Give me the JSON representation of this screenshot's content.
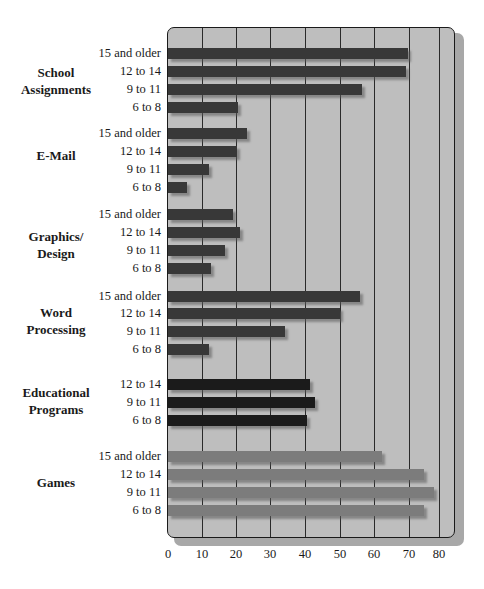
{
  "chart_data": {
    "type": "bar",
    "orientation": "horizontal",
    "title": "",
    "xlabel": "",
    "ylabel": "",
    "xlim": [
      0,
      80
    ],
    "x_ticks": [
      0,
      10,
      20,
      30,
      40,
      50,
      60,
      70,
      80
    ],
    "grid": "vertical",
    "legend": "none",
    "groups": [
      {
        "category": "School Assignments",
        "label_lines": [
          "School",
          "Assignments"
        ],
        "color": "#383838",
        "bars": [
          {
            "age": "15 and older",
            "value": 70
          },
          {
            "age": "12 to 14",
            "value": 69.5
          },
          {
            "age": "9 to 11",
            "value": 56.5
          },
          {
            "age": "6 to 8",
            "value": 20.5
          }
        ]
      },
      {
        "category": "E-Mail",
        "label_lines": [
          "E-Mail"
        ],
        "color": "#383838",
        "bars": [
          {
            "age": "15 and older",
            "value": 23
          },
          {
            "age": "12 to 14",
            "value": 20
          },
          {
            "age": "9 to 11",
            "value": 12
          },
          {
            "age": "6 to 8",
            "value": 5.5
          }
        ]
      },
      {
        "category": "Graphics/ Design",
        "label_lines": [
          "Graphics/",
          "Design"
        ],
        "color": "#383838",
        "bars": [
          {
            "age": "15 and older",
            "value": 19
          },
          {
            "age": "12 to 14",
            "value": 21
          },
          {
            "age": "9 to 11",
            "value": 16.5
          },
          {
            "age": "6 to 8",
            "value": 12.5
          }
        ]
      },
      {
        "category": "Word Processing",
        "label_lines": [
          "Word",
          "Processing"
        ],
        "color": "#383838",
        "bars": [
          {
            "age": "15 and older",
            "value": 56
          },
          {
            "age": "12 to 14",
            "value": 50
          },
          {
            "age": "9 to 11",
            "value": 34
          },
          {
            "age": "6 to 8",
            "value": 12
          }
        ]
      },
      {
        "category": "Educational Programs",
        "label_lines": [
          "Educational",
          "Programs"
        ],
        "color": "#1b1b1b",
        "bars": [
          {
            "age": "12 to 14",
            "value": 41.5
          },
          {
            "age": "9 to 11",
            "value": 43
          },
          {
            "age": "6 to 8",
            "value": 40.5
          }
        ]
      },
      {
        "category": "Games",
        "label_lines": [
          "Games"
        ],
        "color": "#7c7c7c",
        "bars": [
          {
            "age": "15 and older",
            "value": 62.5
          },
          {
            "age": "12 to 14",
            "value": 74.5
          },
          {
            "age": "9 to 11",
            "value": 77.5
          },
          {
            "age": "6 to 8",
            "value": 74.5
          }
        ]
      }
    ]
  },
  "layout": {
    "plot_left": 168,
    "px_per_unit": 3.43,
    "gridline_x": [
      202,
      236,
      270,
      305,
      340,
      374,
      409,
      439
    ],
    "bar_tops": [
      [
        48,
        66,
        84,
        102
      ],
      [
        128,
        146,
        164,
        182
      ],
      [
        209,
        227,
        245,
        263
      ],
      [
        291,
        308,
        326,
        344
      ],
      [
        379,
        397,
        415
      ],
      [
        451,
        469,
        487,
        505
      ]
    ],
    "cat_label_tops": [
      [
        64,
        81
      ],
      [
        147
      ],
      [
        228,
        245
      ],
      [
        304,
        321
      ],
      [
        384,
        401
      ],
      [
        474
      ]
    ]
  }
}
